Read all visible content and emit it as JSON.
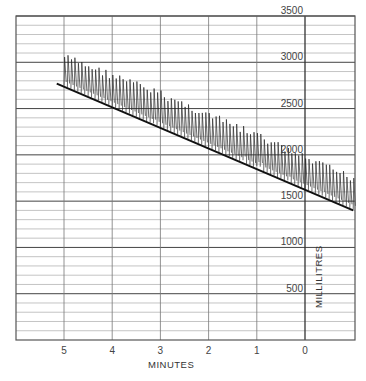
{
  "chart_data": {
    "type": "line",
    "title": "",
    "xlabel": "MINUTES",
    "ylabel": "MILLILITRES",
    "x_ticks": [
      "5",
      "4",
      "3",
      "2",
      "1",
      "0"
    ],
    "x_tick_values": [
      5,
      4,
      3,
      2,
      1,
      0
    ],
    "y_ticks": [
      "500",
      "1000",
      "1500",
      "2000",
      "2500",
      "3000",
      "3500"
    ],
    "y_tick_values": [
      500,
      1000,
      1500,
      2000,
      2500,
      3000,
      3500
    ],
    "xlim": [
      5.9,
      -1.05
    ],
    "ylim": [
      0,
      3500
    ],
    "grid": true,
    "minor_y_step": 100,
    "series": [
      {
        "name": "baseline (end-expiratory level)",
        "x": [
          5.15,
          -1.0
        ],
        "values": [
          2770,
          1400
        ]
      },
      {
        "name": "spirometer tracing (breath peaks)",
        "x": [
          5.0,
          4.0,
          3.0,
          2.0,
          1.0,
          0.0,
          -1.0
        ],
        "values": [
          3100,
          2900,
          2700,
          2470,
          2250,
          2000,
          1790
        ]
      }
    ],
    "breath_tidal_volume_ml": 350,
    "breaths_per_minute_approx": 14
  }
}
